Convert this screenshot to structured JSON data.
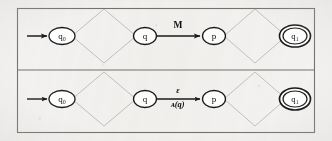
{
  "figure": {
    "background_color": "#f3f2f0",
    "frame_color": "#6e6c6a",
    "node_color": "#1a1a1a",
    "diamond_color": "#bdbcba",
    "arrow_color": "#1a1a1a",
    "panel_divider_color": "#6e6c6a"
  },
  "panels": [
    {
      "id": "top-panel",
      "name": "before-transformation",
      "nodes": [
        {
          "id": "q0",
          "label": "q₀",
          "type": "start",
          "cx": 62,
          "cy": 36,
          "rx": 13,
          "ry": 8.5
        },
        {
          "id": "q",
          "label": "q",
          "type": "normal",
          "cx": 145,
          "cy": 36,
          "rx": 11.5,
          "ry": 8.5
        },
        {
          "id": "p",
          "label": "p",
          "type": "normal",
          "cx": 214,
          "cy": 36,
          "rx": 11.5,
          "ry": 8.5
        },
        {
          "id": "q1",
          "label": "q₁",
          "type": "accept",
          "cx": 295,
          "cy": 36,
          "rx": 13,
          "ry": 8.5
        }
      ],
      "diamonds": [
        {
          "id": "d1",
          "cx": 104,
          "cy": 36,
          "rx": 32,
          "ry": 27
        },
        {
          "id": "d2",
          "cx": 255,
          "cy": 36,
          "rx": 31,
          "ry": 27
        }
      ],
      "start_arrow": {
        "x1": 27,
        "y1": 36,
        "x2": 48,
        "y2": 36
      },
      "transition": {
        "from": "q",
        "to": "p",
        "x1": 157,
        "x2": 201,
        "y": 36,
        "label_top": "M",
        "label_bottom": ""
      }
    },
    {
      "id": "bottom-panel",
      "name": "after-transformation",
      "nodes": [
        {
          "id": "q0",
          "label": "q₀",
          "type": "start",
          "cx": 62,
          "cy": 99,
          "rx": 13,
          "ry": 8.5
        },
        {
          "id": "q",
          "label": "q",
          "type": "normal",
          "cx": 145,
          "cy": 99,
          "rx": 11.5,
          "ry": 8.5
        },
        {
          "id": "p",
          "label": "p",
          "type": "normal",
          "cx": 214,
          "cy": 99,
          "rx": 11.5,
          "ry": 8.5
        },
        {
          "id": "q1",
          "label": "q₁",
          "type": "accept",
          "cx": 295,
          "cy": 99,
          "rx": 13,
          "ry": 8.5
        }
      ],
      "diamonds": [
        {
          "id": "d1",
          "cx": 104,
          "cy": 99,
          "rx": 32,
          "ry": 27
        },
        {
          "id": "d2",
          "cx": 255,
          "cy": 99,
          "rx": 31,
          "ry": 27
        }
      ],
      "start_arrow": {
        "x1": 27,
        "y1": 99,
        "x2": 48,
        "y2": 99
      },
      "transition": {
        "from": "q",
        "to": "p",
        "x1": 157,
        "x2": 201,
        "y": 99,
        "label_top": "ε",
        "label_bottom": "ᴀ(q)",
        "label_bottom_script": "A",
        "label_bottom_arg": "(q)"
      }
    }
  ],
  "frame": {
    "x": 17,
    "y": 8,
    "width": 298,
    "height": 125,
    "divider_y": 70
  }
}
